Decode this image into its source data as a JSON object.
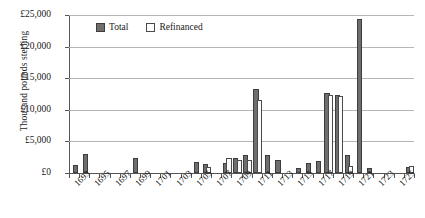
{
  "chart_data": {
    "type": "bar",
    "title": "",
    "xlabel": "",
    "ylabel": "Thousand pounds sterling",
    "ylim": [
      0,
      25000
    ],
    "ytick_labels": [
      "£0",
      "£5,000",
      "£10,000",
      "£15,000",
      "£20,000",
      "£25,000"
    ],
    "ytick_values": [
      0,
      5000,
      10000,
      15000,
      20000,
      25000
    ],
    "grid": true,
    "legend_position": "top-left-inside",
    "categories": [
      1693,
      1694,
      1695,
      1696,
      1697,
      1698,
      1699,
      1700,
      1701,
      1702,
      1703,
      1704,
      1705,
      1706,
      1707,
      1708,
      1709,
      1710,
      1711,
      1712,
      1713,
      1714,
      1715,
      1716,
      1717,
      1718,
      1719,
      1720,
      1721,
      1722,
      1723,
      1724,
      1725,
      1726
    ],
    "xtick_labels": [
      "1693",
      "1695",
      "1697",
      "1699",
      "1701",
      "1703",
      "1705",
      "1707",
      "1709",
      "1711",
      "1713",
      "1715",
      "1717",
      "1719",
      "1721",
      "1723",
      "1725"
    ],
    "series": [
      {
        "name": "Total",
        "color": "#6e6e6e",
        "values": [
          1000,
          2700,
          0,
          0,
          0,
          0,
          2100,
          0,
          0,
          0,
          0,
          0,
          1500,
          1100,
          0,
          1250,
          2100,
          2600,
          12900,
          2600,
          1800,
          0,
          500,
          1200,
          1600,
          12300,
          12000,
          2500,
          24000,
          400,
          0,
          0,
          0,
          700
        ]
      },
      {
        "name": "Refinanced",
        "color": "#ffffff",
        "values": [
          0,
          0,
          0,
          0,
          0,
          0,
          0,
          0,
          0,
          0,
          0,
          0,
          0,
          600,
          0,
          2000,
          1800,
          1700,
          11200,
          0,
          0,
          0,
          0,
          0,
          0,
          12000,
          11900,
          800,
          0,
          0,
          0,
          0,
          0,
          800
        ]
      }
    ]
  },
  "legend": {
    "total_label": "Total",
    "refinanced_label": "Refinanced"
  }
}
